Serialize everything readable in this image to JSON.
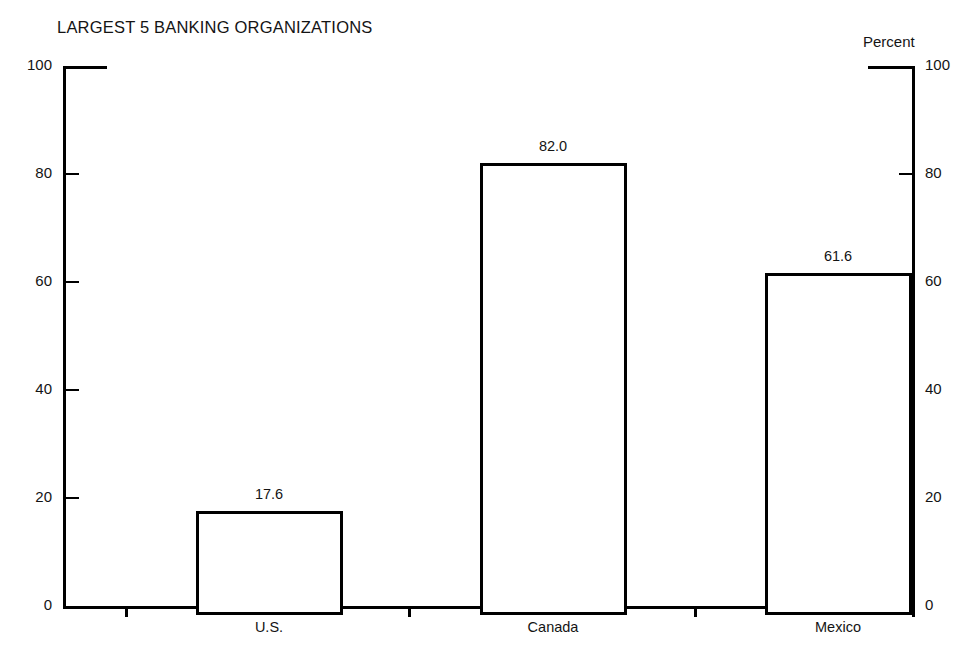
{
  "chart_data": {
    "type": "bar",
    "title": "LARGEST 5 BANKING ORGANIZATIONS",
    "axis_unit_label": "Percent",
    "xlabel": "",
    "ylabel": "Percent",
    "categories": [
      "U.S.",
      "Canada",
      "Mexico"
    ],
    "values": [
      17.6,
      82.0,
      61.6
    ],
    "value_labels": [
      "17.6",
      "82.0",
      "61.6"
    ],
    "ylim": [
      0,
      100
    ],
    "yticks": [
      0,
      20,
      40,
      60,
      80,
      100
    ],
    "ytick_labels_left": [
      "100",
      "80",
      "60",
      "40",
      "20",
      "0"
    ],
    "ytick_labels_right": [
      "100",
      "80",
      "60",
      "40",
      "20",
      "0"
    ],
    "grid": false,
    "legend": null,
    "bar_style": {
      "fill": "#ffffff",
      "edge": "#000000",
      "edge_width_px": 3
    },
    "series": [
      {
        "name": "Largest 5 banking organizations share",
        "values": [
          17.6,
          82.0,
          61.6
        ]
      }
    ]
  },
  "colors": {
    "background": "#ffffff",
    "ink": "#000000",
    "text": "#141414"
  }
}
